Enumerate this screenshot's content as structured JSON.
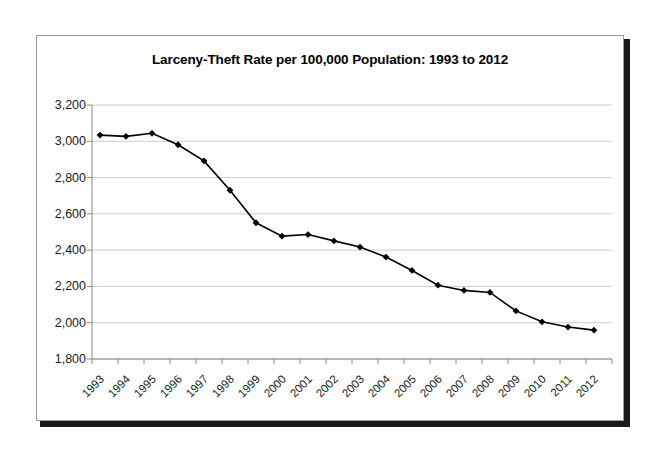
{
  "chart_data": {
    "type": "line",
    "title": "Larceny-Theft Rate per 100,000 Population: 1993 to 2012",
    "xlabel": "",
    "ylabel": "",
    "categories": [
      "1993",
      "1994",
      "1995",
      "1996",
      "1997",
      "1998",
      "1999",
      "2000",
      "2001",
      "2002",
      "2003",
      "2004",
      "2005",
      "2006",
      "2007",
      "2008",
      "2009",
      "2010",
      "2011",
      "2012"
    ],
    "values": [
      3034,
      3027,
      3044,
      2981,
      2892,
      2730,
      2551,
      2477,
      2486,
      2451,
      2417,
      2362,
      2288,
      2207,
      2178,
      2167,
      2065,
      2005,
      1976,
      1959
    ],
    "series": [
      {
        "name": "Larceny-Theft Rate",
        "values": [
          3034,
          3027,
          3044,
          2981,
          2892,
          2730,
          2551,
          2477,
          2486,
          2451,
          2417,
          2362,
          2288,
          2207,
          2178,
          2167,
          2065,
          2005,
          1976,
          1959
        ]
      }
    ],
    "ylim": [
      1800,
      3200
    ],
    "ytick_step": 200,
    "ytick_labels": [
      "3,200",
      "3,000",
      "2,800",
      "2,600",
      "2,400",
      "2,200",
      "2,000",
      "1,800"
    ],
    "ytick_values": [
      3200,
      3000,
      2800,
      2600,
      2400,
      2200,
      2000,
      1800
    ],
    "grid": "horizontal",
    "legend": "none",
    "line_color": "#000000",
    "marker_color": "#000000",
    "grid_color": "#cccccc",
    "axis_color": "#888888"
  },
  "figure": {
    "background_color": "#ffffff",
    "frame_border_color": "#9a9a9a",
    "frame_shadow_color": "#1a1a1a"
  }
}
